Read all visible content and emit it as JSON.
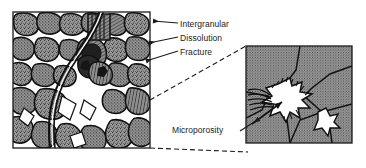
{
  "figure": {
    "type": "petrographic-thin-section-diagram",
    "background_color": "#ffffff",
    "line_color": "#1a1a1a",
    "grain_fill_color": "#8a8a8a",
    "pore_fill_color": "#ffffff"
  },
  "panels": {
    "left": {
      "name": "sandstone-thin-section",
      "x": 13,
      "y": 12,
      "width": 137,
      "height": 136,
      "border_color": "#1a1a1a"
    },
    "right": {
      "name": "magnified-pore-detail",
      "x": 246,
      "y": 46,
      "width": 106,
      "height": 97,
      "border_color": "#1a1a1a"
    }
  },
  "annotations": [
    {
      "id": "intergranular",
      "label": "Intergranular",
      "text_x": 180,
      "text_y": 26,
      "leader_from_x": 178,
      "leader_from_y": 23,
      "leader_to_x": 150,
      "leader_to_y": 21,
      "arrow": true
    },
    {
      "id": "dissolution",
      "label": "Dissolution",
      "text_x": 180,
      "text_y": 40,
      "leader_from_x": 178,
      "leader_from_y": 37,
      "leader_to_x": 146,
      "leader_to_y": 43,
      "arrow": true
    },
    {
      "id": "fracture",
      "label": "Fracture",
      "text_x": 180,
      "text_y": 54,
      "leader_from_x": 178,
      "leader_from_y": 51,
      "leader_to_x": 143,
      "leader_to_y": 61,
      "arrow": true
    },
    {
      "id": "microporosity",
      "label": "Microporosity",
      "text_x": 175,
      "text_y": 132,
      "leader_from_x": 240,
      "leader_from_y": 130,
      "leader_to_x": 262,
      "leader_to_y": 117,
      "arrow": true
    }
  ],
  "magnification_cone": {
    "name": "magnification-cone",
    "dash_pattern": "5,3",
    "upper_line": {
      "x1": 150,
      "y1": 100,
      "x2": 246,
      "y2": 46
    },
    "lower_line": {
      "x1": 150,
      "y1": 148,
      "x2": 246,
      "y2": 152
    }
  }
}
